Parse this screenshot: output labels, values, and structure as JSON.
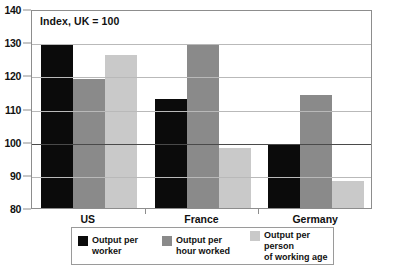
{
  "chart_data": {
    "type": "bar",
    "title": "Index, UK = 100",
    "xlabel": "",
    "ylabel": "",
    "ylim": [
      80,
      140
    ],
    "yticks": [
      80,
      90,
      100,
      110,
      120,
      130,
      140
    ],
    "grid": true,
    "reference_line": 100,
    "legend_position": "bottom",
    "categories": [
      "US",
      "France",
      "Germany"
    ],
    "series": [
      {
        "name": "Output per worker",
        "color": "#0b0b0b",
        "values": [
          129,
          113,
          99
        ]
      },
      {
        "name": "Output per hour worked",
        "color": "#8a8a8a",
        "values": [
          119,
          129,
          114
        ]
      },
      {
        "name": "Output per person of working age",
        "color": "#c9c9c9",
        "values": [
          126,
          98,
          88
        ]
      }
    ]
  },
  "legend": {
    "items": [
      {
        "label_line1": "Output per",
        "label_line2": "worker",
        "swatch": "black-swatch-icon"
      },
      {
        "label_line1": "Output per",
        "label_line2": "hour worked",
        "swatch": "gray-swatch-icon"
      },
      {
        "label_line1": "Output per person",
        "label_line2": "of working age",
        "swatch": "light-gray-swatch-icon"
      }
    ]
  }
}
